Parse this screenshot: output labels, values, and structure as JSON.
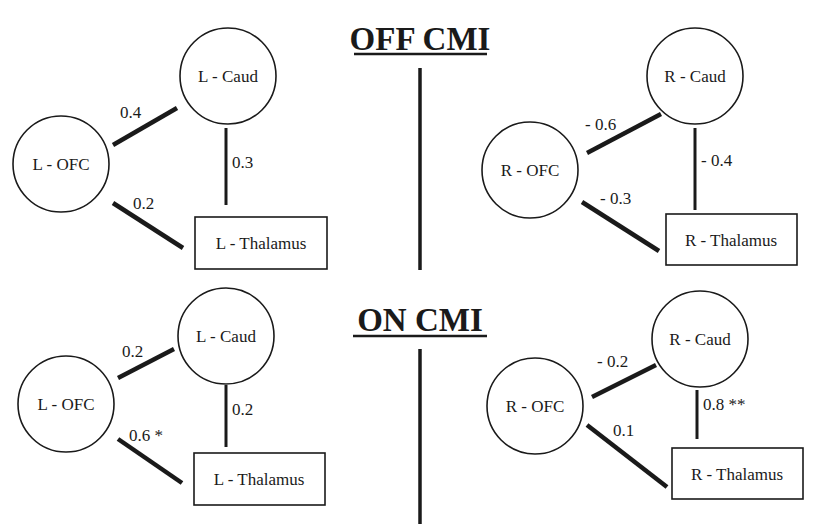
{
  "panels": {
    "off_title": "OFF CMI",
    "on_title": "ON CMI"
  },
  "off": {
    "left": {
      "nodes": {
        "ofc": "L - OFC",
        "caud": "L - Caud",
        "thal": "L - Thalamus"
      },
      "edges": {
        "ofc_caud": "0.4",
        "ofc_thal": "0.2",
        "caud_thal": "0.3"
      }
    },
    "right": {
      "nodes": {
        "ofc": "R - OFC",
        "caud": "R - Caud",
        "thal": "R - Thalamus"
      },
      "edges": {
        "ofc_caud": "- 0.6",
        "ofc_thal": "- 0.3",
        "caud_thal": "- 0.4"
      }
    }
  },
  "on": {
    "left": {
      "nodes": {
        "ofc": "L - OFC",
        "caud": "L - Caud",
        "thal": "L - Thalamus"
      },
      "edges": {
        "ofc_caud": "0.2",
        "ofc_thal": "0.6 *",
        "caud_thal": "0.2"
      }
    },
    "right": {
      "nodes": {
        "ofc": "R - OFC",
        "caud": "R - Caud",
        "thal": "R - Thalamus"
      },
      "edges": {
        "ofc_caud": "- 0.2",
        "ofc_thal": "0.1",
        "caud_thal": "0.8 **"
      }
    }
  }
}
